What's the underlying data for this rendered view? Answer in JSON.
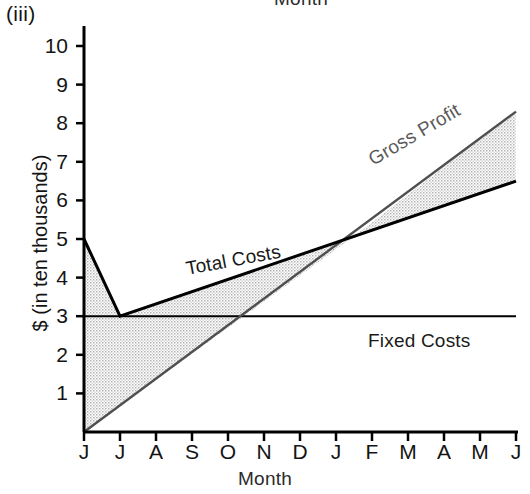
{
  "figure": {
    "panel_label": "(iii)",
    "clipped_title_above": "Month"
  },
  "axes": {
    "y_title": "$ (in ten thousands)",
    "x_title": "Month",
    "y_ticks": [
      1,
      2,
      3,
      4,
      5,
      6,
      7,
      8,
      9,
      10
    ],
    "x_ticks": [
      "J",
      "J",
      "A",
      "S",
      "O",
      "N",
      "D",
      "J",
      "F",
      "M",
      "A",
      "M",
      "J"
    ]
  },
  "annotations": {
    "total_costs": "Total Costs",
    "gross_profit": "Gross Profit",
    "fixed_costs": "Fixed Costs"
  },
  "colors": {
    "line": "#000000",
    "revenue_line": "#5a5a5a",
    "fill": "#cccccc",
    "text": "#141414",
    "background": "#ffffff"
  },
  "chart_data": {
    "type": "line",
    "title": "",
    "subtitle": "(iii)",
    "xlabel": "Month",
    "ylabel": "$ (in ten thousands)",
    "categories": [
      "J",
      "J",
      "A",
      "S",
      "O",
      "N",
      "D",
      "J",
      "F",
      "M",
      "A",
      "M",
      "J"
    ],
    "xlim": [
      0,
      12
    ],
    "ylim": [
      0,
      10
    ],
    "grid": false,
    "legend_position": "inline-labels",
    "series": [
      {
        "name": "Total Costs",
        "label_rotation_deg": -10.5,
        "points": [
          {
            "x": 0,
            "y": 5.0
          },
          {
            "x": 1,
            "y": 3.0
          },
          {
            "x": 12,
            "y": 6.5
          }
        ]
      },
      {
        "name": "Fixed Costs",
        "label_rotation_deg": 0,
        "points": [
          {
            "x": 0,
            "y": 3.0
          },
          {
            "x": 12,
            "y": 3.0
          }
        ]
      },
      {
        "name": "Gross Profit",
        "description": "Sales revenue line rising linearly from the origin",
        "label_rotation_deg": -30.5,
        "points": [
          {
            "x": 0,
            "y": 0.0
          },
          {
            "x": 12,
            "y": 8.3
          }
        ]
      }
    ],
    "shaded_regions": [
      {
        "name": "loss-area",
        "pattern": "dot-stipple",
        "between": [
          "Total Costs",
          "Gross Profit"
        ],
        "x_range": [
          0,
          7.4
        ]
      },
      {
        "name": "gross-profit-area",
        "pattern": "dot-stipple",
        "between": [
          "Gross Profit",
          "Total Costs"
        ],
        "x_range": [
          7.4,
          12
        ]
      }
    ],
    "break_even": {
      "x": 7.4,
      "y": 5.0,
      "month": "J"
    }
  }
}
